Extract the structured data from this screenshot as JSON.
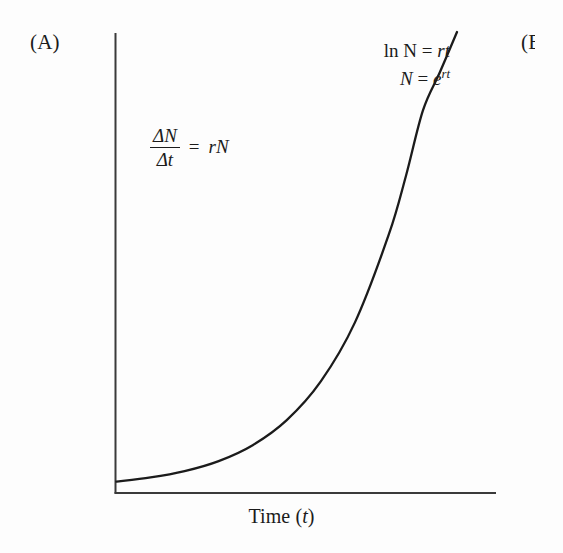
{
  "figure": {
    "panel_a_label": "(A)",
    "panel_b_label": "(B)"
  },
  "axes": {
    "y_title_prefix": "Number of organisms (",
    "y_title_var": "N",
    "y_title_suffix": ")",
    "x_title_prefix": "Time (",
    "x_title_var": "t",
    "x_title_suffix": ")"
  },
  "equations": {
    "differential": {
      "numerator": "ΔN",
      "denominator": "Δt",
      "equals": "=",
      "right_side": "rN"
    },
    "solution_line_1": {
      "left": "ln N",
      "equals": "=",
      "right": "rt"
    },
    "solution_line_2": {
      "left": "N",
      "equals": "=",
      "right_base": "e",
      "right_exponent": "rt"
    }
  },
  "chart_data": {
    "type": "line",
    "title": "",
    "subtitle": "",
    "xlabel": "Time (t)",
    "ylabel": "Number of organisms (N)",
    "grid": false,
    "legend": false,
    "axis_ticks": [],
    "annotations": [
      "ΔN/Δt = rN",
      "ln N = rt",
      "N = e^rt"
    ],
    "series": [
      {
        "name": "Exponential growth",
        "description": "N = e^(rt), unbounded exponential increase",
        "color": "#1b1b1b",
        "x": [
          0,
          0.1,
          0.2,
          0.3,
          0.4,
          0.5,
          0.6,
          0.7,
          0.8,
          0.85,
          0.9,
          0.95,
          1.0
        ],
        "y": [
          0.013,
          0.022,
          0.036,
          0.058,
          0.093,
          0.148,
          0.233,
          0.362,
          0.556,
          0.684,
          0.828,
          0.912,
          1.0
        ]
      }
    ],
    "xlim": [
      0,
      1
    ],
    "ylim": [
      0,
      1
    ]
  }
}
